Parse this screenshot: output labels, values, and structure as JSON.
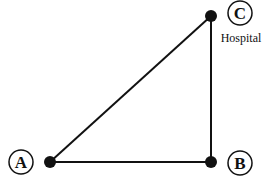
{
  "diagram": {
    "points": [
      {
        "id": "A",
        "label": "A",
        "x": 50,
        "y": 162,
        "label_x": 21,
        "label_y": 162
      },
      {
        "id": "B",
        "label": "B",
        "x": 211,
        "y": 162,
        "label_x": 240,
        "label_y": 163
      },
      {
        "id": "C",
        "label": "C",
        "x": 211,
        "y": 16,
        "label_x": 240,
        "label_y": 13
      }
    ],
    "edges": [
      [
        "A",
        "B"
      ],
      [
        "B",
        "C"
      ],
      [
        "A",
        "C"
      ]
    ],
    "annotations": {
      "C": "Hospital"
    },
    "colors": {
      "line": "#111111",
      "dot": "#111111"
    }
  }
}
